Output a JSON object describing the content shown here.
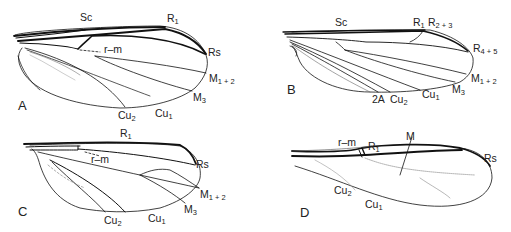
{
  "figure": {
    "panels": [
      {
        "id": "A",
        "labels": {
          "sc": "Sc",
          "r1": "R",
          "r1_sub": "1",
          "rs": "Rs",
          "rm": "r–m",
          "m12": "M",
          "m12_sub": "1 + 2",
          "m3": "M",
          "m3_sub": "3",
          "cu2": "Cu",
          "cu2_sub": "2",
          "cu1": "Cu",
          "cu1_sub": "1"
        }
      },
      {
        "id": "B",
        "labels": {
          "sc": "Sc",
          "r1": "R",
          "r1_sub": "1",
          "r23": "R",
          "r23_sub": "2 + 3",
          "r45": "R",
          "r45_sub": "4 + 5",
          "m12": "M",
          "m12_sub": "1 + 2",
          "m3": "M",
          "m3_sub": "3",
          "a2": "2A",
          "cu2": "Cu",
          "cu2_sub": "2",
          "cu1": "Cu",
          "cu1_sub": "1"
        }
      },
      {
        "id": "C",
        "labels": {
          "r1": "R",
          "r1_sub": "1",
          "rm": "r–m",
          "rs": "Rs",
          "m12": "M",
          "m12_sub": "1 + 2",
          "m3": "M",
          "m3_sub": "3",
          "cu2": "Cu",
          "cu2_sub": "2",
          "cu1": "Cu",
          "cu1_sub": "1"
        }
      },
      {
        "id": "D",
        "labels": {
          "rm": "r–m",
          "r1": "R",
          "r1_sub": "1",
          "m": "M",
          "rs": "Rs",
          "cu2": "Cu",
          "cu2_sub": "2",
          "cu1": "Cu",
          "cu1_sub": "1"
        }
      }
    ]
  }
}
